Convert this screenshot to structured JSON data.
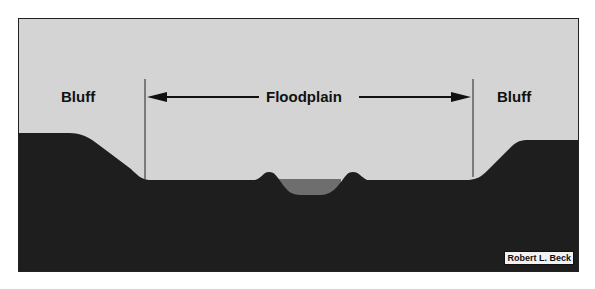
{
  "diagram": {
    "labels": {
      "left_bluff": "Bluff",
      "floodplain": "Floodplain",
      "right_bluff": "Bluff"
    },
    "credit": "Robert L. Beck",
    "colors": {
      "sky": "#d4d4d4",
      "ground": "#1e1e1e",
      "water": "#6e6e6e",
      "border": "#222222"
    },
    "elements": [
      "left bluff",
      "floodplain",
      "natural levee",
      "river channel",
      "natural levee",
      "right bluff"
    ]
  }
}
